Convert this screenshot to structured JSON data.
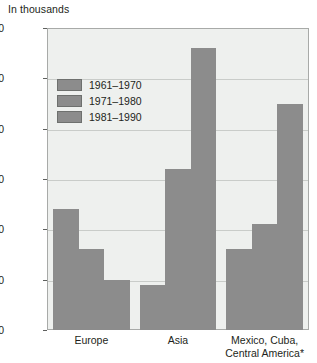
{
  "chart_data": {
    "type": "bar",
    "title": "",
    "unit_caption": "In thousands",
    "xlabel": "",
    "ylabel": "",
    "ylim": [
      0,
      3000
    ],
    "ytick_values": [
      0,
      500,
      1000,
      1500,
      2000,
      2500,
      3000
    ],
    "ytick_labels": [
      "0",
      "500",
      "1,000",
      "1,500",
      "2,000",
      "2,500",
      "3,000"
    ],
    "grid": true,
    "legend_position": "upper-left-inside",
    "categories": [
      "Europe",
      "Asia",
      "Mexico, Cuba,\nCentral America*"
    ],
    "series": [
      {
        "name": "1961–1970",
        "color": "#8c8c8c",
        "values": [
          1200,
          450,
          800
        ]
      },
      {
        "name": "1971–1980",
        "color": "#8c8c8c",
        "values": [
          800,
          1600,
          1050
        ]
      },
      {
        "name": "1981–1990",
        "color": "#8c8c8c",
        "values": [
          500,
          2800,
          2250
        ]
      }
    ],
    "annotations": [
      "*"
    ],
    "colors": {
      "bar": "#8c8c8c",
      "plot_background": "#eef0ee",
      "gridline": "#c9ccc9",
      "frame": "#a8aaa8",
      "text": "#231f20",
      "page_background": "#ffffff"
    }
  }
}
